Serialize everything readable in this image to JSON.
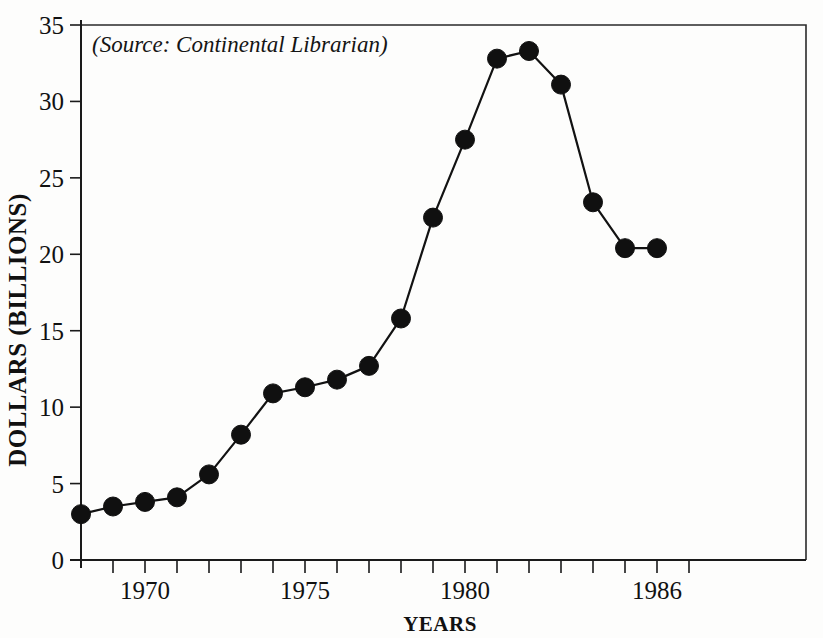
{
  "chart_data": {
    "type": "line",
    "title": "",
    "subtitle": "",
    "annotation": "(Source: Continental Librarian)",
    "xlabel": "YEARS",
    "ylabel": "DOLLARS (BILLIONS)",
    "xlim": [
      1968,
      1987
    ],
    "ylim": [
      0,
      35
    ],
    "grid": false,
    "legend": false,
    "x_tick_labels": [
      "1970",
      "1975",
      "1980",
      "1986"
    ],
    "x_tick_label_values": [
      1970,
      1975,
      1980,
      1986
    ],
    "x_minor_tick_values": [
      1969,
      1970,
      1971,
      1972,
      1973,
      1974,
      1975,
      1976,
      1977,
      1978,
      1979,
      1980,
      1981,
      1982,
      1983,
      1984,
      1985,
      1986,
      1987
    ],
    "y_tick_labels": [
      "0",
      "5",
      "10",
      "15",
      "20",
      "25",
      "30",
      "35"
    ],
    "y_tick_values": [
      0,
      5,
      10,
      15,
      20,
      25,
      30,
      35
    ],
    "series": [
      {
        "name": "Dollars (billions)",
        "marker": "filled-circle",
        "color": "#101010",
        "x": [
          1968,
          1969,
          1970,
          1971,
          1972,
          1973,
          1974,
          1975,
          1976,
          1977,
          1978,
          1979,
          1980,
          1981,
          1982,
          1983,
          1984,
          1985,
          1986
        ],
        "values": [
          3.0,
          3.5,
          3.8,
          4.1,
          5.6,
          8.2,
          10.9,
          11.3,
          11.8,
          12.7,
          15.8,
          22.4,
          27.5,
          32.8,
          33.3,
          31.1,
          23.4,
          20.4,
          20.4
        ]
      }
    ]
  },
  "colors": {
    "ink": "#101010",
    "axis": "#1a1a1a",
    "background": "#fdfdfc"
  }
}
